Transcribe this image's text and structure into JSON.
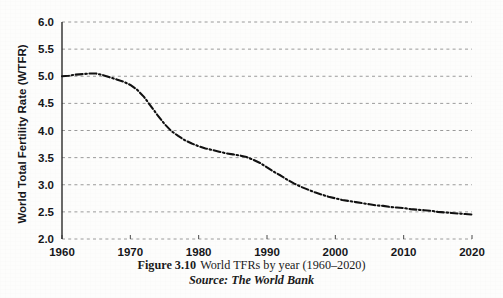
{
  "figure": {
    "caption_number": "Figure 3.10",
    "caption_text": "World TFRs by year (1960–2020)",
    "source": "Source: The World Bank"
  },
  "chart_data": {
    "type": "line",
    "title": "",
    "xlabel": "",
    "ylabel": "World Total Fertility Rate (WTFR)",
    "xlim": [
      1960,
      2020
    ],
    "ylim": [
      2.0,
      6.0
    ],
    "grid": true,
    "legend": "none",
    "line_style": "dash-dot",
    "line_color": "#111111",
    "xticks": [
      1960,
      1970,
      1980,
      1990,
      2000,
      2010,
      2020
    ],
    "xtick_labels": [
      "1960",
      "1970",
      "1980",
      "1990",
      "2000",
      "2010",
      "2020"
    ],
    "yticks": [
      2.0,
      2.5,
      3.0,
      3.5,
      4.0,
      4.5,
      5.0,
      5.5,
      6.0
    ],
    "ytick_labels": [
      "2.0",
      "2.5",
      "3.0",
      "3.5",
      "4.0",
      "4.5",
      "5.0",
      "5.5",
      "6.0"
    ],
    "series": [
      {
        "name": "World Total Fertility Rate",
        "x": [
          1960,
          1961,
          1962,
          1963,
          1964,
          1965,
          1966,
          1967,
          1968,
          1969,
          1970,
          1971,
          1972,
          1973,
          1974,
          1975,
          1976,
          1977,
          1978,
          1979,
          1980,
          1981,
          1982,
          1983,
          1984,
          1985,
          1986,
          1987,
          1988,
          1989,
          1990,
          1991,
          1992,
          1993,
          1994,
          1995,
          1996,
          1997,
          1998,
          1999,
          2000,
          2001,
          2002,
          2003,
          2004,
          2005,
          2006,
          2007,
          2008,
          2009,
          2010,
          2011,
          2012,
          2013,
          2014,
          2015,
          2016,
          2017,
          2018,
          2019,
          2020
        ],
        "values": [
          5.0,
          5.01,
          5.03,
          5.04,
          5.05,
          5.05,
          5.02,
          4.98,
          4.94,
          4.9,
          4.84,
          4.75,
          4.62,
          4.45,
          4.28,
          4.12,
          3.99,
          3.9,
          3.82,
          3.76,
          3.71,
          3.67,
          3.64,
          3.61,
          3.58,
          3.56,
          3.54,
          3.51,
          3.46,
          3.4,
          3.32,
          3.24,
          3.17,
          3.09,
          3.02,
          2.96,
          2.91,
          2.86,
          2.82,
          2.78,
          2.75,
          2.72,
          2.7,
          2.68,
          2.66,
          2.64,
          2.62,
          2.61,
          2.59,
          2.58,
          2.57,
          2.55,
          2.54,
          2.53,
          2.52,
          2.5,
          2.49,
          2.48,
          2.47,
          2.46,
          2.45
        ]
      }
    ]
  }
}
